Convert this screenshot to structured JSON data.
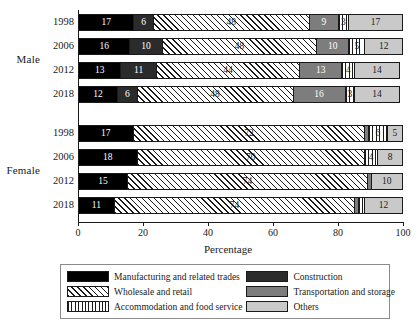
{
  "chart_data": {
    "type": "bar",
    "orientation": "horizontal",
    "stacked": true,
    "title": "",
    "xlabel": "Percentage",
    "ylabel": "",
    "xlim": [
      0,
      100
    ],
    "xticks": [
      0,
      20,
      40,
      60,
      80,
      100
    ],
    "grid": false,
    "legend_position": "bottom",
    "groups": [
      "Male",
      "Female"
    ],
    "categories": [
      "1998",
      "2006",
      "2012",
      "2018"
    ],
    "series": [
      {
        "name": "Manufacturing and related trades",
        "key": "manufacturing",
        "color": "#000000",
        "pattern": "solid"
      },
      {
        "name": "Construction",
        "key": "construction",
        "color": "#2b2b2b",
        "pattern": "solid"
      },
      {
        "name": "Wholesale and retail",
        "key": "wholesale",
        "color": "#ffffff",
        "pattern": "diagonal-hatch"
      },
      {
        "name": "Transportation and storage",
        "key": "transportation",
        "color": "#7d7d7d",
        "pattern": "solid"
      },
      {
        "name": "Accommodation and food service",
        "key": "accommodation",
        "color": "#ffffff",
        "pattern": "vertical-hatch"
      },
      {
        "name": "Others",
        "key": "others",
        "color": "#c9c9c9",
        "pattern": "solid"
      }
    ],
    "data": [
      {
        "group": "Male",
        "rows": [
          {
            "year": "1998",
            "segments": [
              {
                "key": "manufacturing",
                "value": 17,
                "label": "17"
              },
              {
                "key": "construction",
                "value": 6,
                "label": "6"
              },
              {
                "key": "wholesale",
                "value": 48,
                "label": "48"
              },
              {
                "key": "transportation",
                "value": 9,
                "label": "9"
              },
              {
                "key": "accommodation",
                "value": 3,
                "label": "3"
              },
              {
                "key": "others",
                "value": 17,
                "label": "17"
              }
            ]
          },
          {
            "year": "2006",
            "segments": [
              {
                "key": "manufacturing",
                "value": 16,
                "label": "16"
              },
              {
                "key": "construction",
                "value": 10,
                "label": "10"
              },
              {
                "key": "wholesale",
                "value": 48,
                "label": "48"
              },
              {
                "key": "transportation",
                "value": 10,
                "label": "10"
              },
              {
                "key": "accommodation",
                "value": 5,
                "label": "5"
              },
              {
                "key": "others",
                "value": 12,
                "label": "12"
              }
            ]
          },
          {
            "year": "2012",
            "segments": [
              {
                "key": "manufacturing",
                "value": 13,
                "label": "13"
              },
              {
                "key": "construction",
                "value": 11,
                "label": "11"
              },
              {
                "key": "wholesale",
                "value": 44,
                "label": "44"
              },
              {
                "key": "transportation",
                "value": 13,
                "label": "13"
              },
              {
                "key": "accommodation",
                "value": 4,
                "label": "4"
              },
              {
                "key": "others",
                "value": 14,
                "label": "14"
              }
            ]
          },
          {
            "year": "2018",
            "segments": [
              {
                "key": "manufacturing",
                "value": 12,
                "label": "12"
              },
              {
                "key": "construction",
                "value": 6,
                "label": "6"
              },
              {
                "key": "wholesale",
                "value": 48,
                "label": "48"
              },
              {
                "key": "transportation",
                "value": 16,
                "label": "16"
              },
              {
                "key": "accommodation",
                "value": 3,
                "label": "3"
              },
              {
                "key": "others",
                "value": 14,
                "label": "14"
              }
            ]
          }
        ]
      },
      {
        "group": "Female",
        "rows": [
          {
            "year": "1998",
            "segments": [
              {
                "key": "manufacturing",
                "value": 17,
                "label": "17"
              },
              {
                "key": "wholesale",
                "value": 72,
                "label": "72"
              },
              {
                "key": "transportation",
                "value": 1,
                "label": ""
              },
              {
                "key": "accommodation",
                "value": 6,
                "label": "6"
              },
              {
                "key": "others",
                "value": 5,
                "label": "5"
              }
            ]
          },
          {
            "year": "2006",
            "segments": [
              {
                "key": "manufacturing",
                "value": 18,
                "label": "18"
              },
              {
                "key": "wholesale",
                "value": 70,
                "label": "70"
              },
              {
                "key": "accommodation",
                "value": 4,
                "label": "4"
              },
              {
                "key": "others",
                "value": 8,
                "label": "8"
              }
            ]
          },
          {
            "year": "2012",
            "segments": [
              {
                "key": "manufacturing",
                "value": 15,
                "label": "15"
              },
              {
                "key": "wholesale",
                "value": 74,
                "label": "74"
              },
              {
                "key": "transportation",
                "value": 1,
                "label": ""
              },
              {
                "key": "others",
                "value": 10,
                "label": "10"
              }
            ]
          },
          {
            "year": "2018",
            "segments": [
              {
                "key": "manufacturing",
                "value": 11,
                "label": "11"
              },
              {
                "key": "wholesale",
                "value": 74,
                "label": "74"
              },
              {
                "key": "transportation",
                "value": 1,
                "label": ""
              },
              {
                "key": "accommodation",
                "value": 2,
                "label": ""
              },
              {
                "key": "others",
                "value": 12,
                "label": "12"
              }
            ]
          }
        ]
      }
    ]
  }
}
